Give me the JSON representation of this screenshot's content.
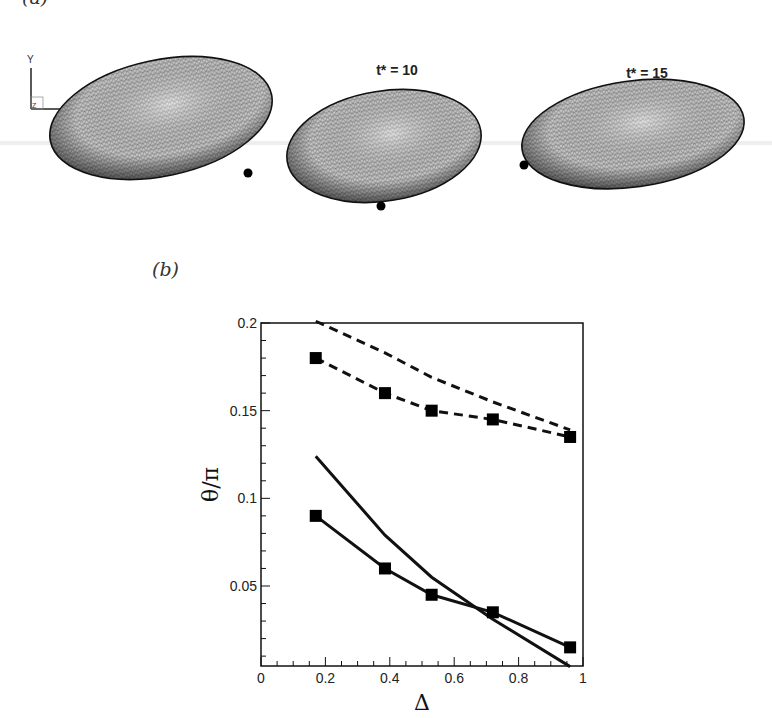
{
  "panel_a": {
    "label": "(a)",
    "snapshots": [
      {
        "time_label": "t* = 5",
        "time_value": 5,
        "cx": 161,
        "cy": 118,
        "rx": 113,
        "ry": 58,
        "rotate": -12,
        "dot": {
          "x": 248,
          "y": 173
        }
      },
      {
        "time_label": "t* = 10",
        "time_value": 10,
        "cx": 384,
        "cy": 146,
        "rx": 98,
        "ry": 55,
        "rotate": -9,
        "dot": {
          "x": 381,
          "y": 206
        }
      },
      {
        "time_label": "t* = 15",
        "time_value": 15,
        "cx": 633,
        "cy": 134,
        "rx": 112,
        "ry": 53,
        "rotate": -8,
        "dot": {
          "x": 524,
          "y": 165
        }
      }
    ],
    "axes_triad": {
      "y_label": "Y",
      "x_label": "X",
      "z_label": "Z"
    }
  },
  "panel_b": {
    "label": "(b)"
  },
  "chart_data": {
    "type": "line",
    "title": "",
    "xlabel": "Δ",
    "ylabel": "θ/π",
    "xlim": [
      0,
      1
    ],
    "ylim": [
      0.004,
      0.2
    ],
    "x_ticks": [
      "0",
      "0.2",
      "0.4",
      "0.6",
      "0.8",
      "1"
    ],
    "y_ticks": [
      "0.05",
      "0.1",
      "0.15",
      "0.2"
    ],
    "grid": false,
    "legend": null,
    "series": [
      {
        "name": "dashed (no markers)",
        "style": "dashed",
        "marker": "none",
        "x": [
          0.17,
          0.385,
          0.53,
          0.72,
          0.96
        ],
        "y": [
          0.201,
          0.183,
          0.169,
          0.155,
          0.139
        ]
      },
      {
        "name": "dashed with squares",
        "style": "dashed",
        "marker": "square",
        "x": [
          0.17,
          0.385,
          0.53,
          0.72,
          0.96
        ],
        "y": [
          0.18,
          0.16,
          0.15,
          0.145,
          0.135
        ]
      },
      {
        "name": "solid (no markers)",
        "style": "solid",
        "marker": "none",
        "x": [
          0.17,
          0.385,
          0.53,
          0.72,
          0.96
        ],
        "y": [
          0.124,
          0.079,
          0.055,
          0.031,
          0.004
        ]
      },
      {
        "name": "solid with squares",
        "style": "solid",
        "marker": "square",
        "x": [
          0.17,
          0.385,
          0.53,
          0.72,
          0.96
        ],
        "y": [
          0.09,
          0.06,
          0.045,
          0.035,
          0.015
        ]
      }
    ]
  }
}
